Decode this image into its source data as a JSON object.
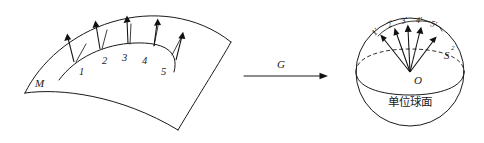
{
  "figure": {
    "caption_alt": "Gauss map of a surface patch onto the unit sphere",
    "background_color": "#ffffff",
    "ink_color": "#1a1a1a"
  },
  "surface": {
    "label": "M",
    "normal_point_labels": [
      "1",
      "2",
      "3",
      "4",
      "5"
    ],
    "normal_vector_count": 5
  },
  "map_arrow": {
    "label": "G"
  },
  "sphere": {
    "label": "S",
    "label_superscript": "2",
    "center_label": "O",
    "caption_cjk": "单位球面",
    "image_point_labels": [
      "1′",
      "2′",
      "3′",
      "4′",
      "5′"
    ],
    "image_vector_count": 5
  }
}
